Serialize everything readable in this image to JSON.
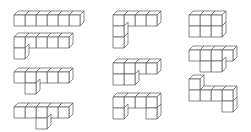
{
  "diagram": {
    "title": "",
    "stroke_color": "#555555",
    "background": "#ffffff",
    "cell_size": 11,
    "depth": {
      "dx": 4,
      "dy": -4
    },
    "figures": [
      {
        "id": "fig-1",
        "origin": [
          14,
          15
        ],
        "cells": [
          [
            0,
            0
          ],
          [
            1,
            0
          ],
          [
            2,
            0
          ],
          [
            3,
            0
          ],
          [
            4,
            0
          ],
          [
            5,
            0
          ]
        ]
      },
      {
        "id": "fig-2",
        "origin": [
          14,
          37
        ],
        "cells": [
          [
            0,
            0
          ],
          [
            1,
            0
          ],
          [
            2,
            0
          ],
          [
            3,
            0
          ],
          [
            4,
            0
          ],
          [
            0,
            1
          ]
        ]
      },
      {
        "id": "fig-3",
        "origin": [
          14,
          72
        ],
        "cells": [
          [
            0,
            0
          ],
          [
            1,
            0
          ],
          [
            2,
            0
          ],
          [
            3,
            0
          ],
          [
            4,
            0
          ],
          [
            1,
            1
          ]
        ]
      },
      {
        "id": "fig-4",
        "origin": [
          14,
          107
        ],
        "cells": [
          [
            0,
            0
          ],
          [
            1,
            0
          ],
          [
            2,
            0
          ],
          [
            3,
            0
          ],
          [
            4,
            0
          ],
          [
            2,
            1
          ]
        ]
      },
      {
        "id": "fig-5",
        "origin": [
          113,
          15
        ],
        "cells": [
          [
            0,
            0
          ],
          [
            1,
            0
          ],
          [
            2,
            0
          ],
          [
            3,
            0
          ],
          [
            0,
            1
          ],
          [
            0,
            2
          ]
        ]
      },
      {
        "id": "fig-6",
        "origin": [
          113,
          63
        ],
        "cells": [
          [
            0,
            0
          ],
          [
            1,
            0
          ],
          [
            2,
            0
          ],
          [
            3,
            0
          ],
          [
            0,
            1
          ],
          [
            1,
            1
          ]
        ]
      },
      {
        "id": "fig-7",
        "origin": [
          113,
          97
        ],
        "cells": [
          [
            0,
            0
          ],
          [
            1,
            0
          ],
          [
            2,
            0
          ],
          [
            3,
            0
          ],
          [
            0,
            1
          ],
          [
            3,
            1
          ]
        ]
      },
      {
        "id": "fig-8",
        "origin": [
          189,
          15
        ],
        "cells": [
          [
            0,
            0
          ],
          [
            1,
            0
          ],
          [
            2,
            0
          ],
          [
            0,
            1
          ],
          [
            1,
            1
          ],
          [
            2,
            1
          ]
        ]
      },
      {
        "id": "fig-9",
        "origin": [
          189,
          50
        ],
        "cells": [
          [
            0,
            0
          ],
          [
            1,
            0
          ],
          [
            2,
            0
          ],
          [
            3,
            0
          ],
          [
            1,
            1
          ],
          [
            2,
            1
          ]
        ]
      },
      {
        "id": "fig-10",
        "origin": [
          189,
          90
        ],
        "cells": [
          [
            0,
            -1
          ],
          [
            0,
            0
          ],
          [
            1,
            0
          ],
          [
            2,
            0
          ],
          [
            3,
            0
          ],
          [
            3,
            1
          ]
        ]
      }
    ]
  }
}
